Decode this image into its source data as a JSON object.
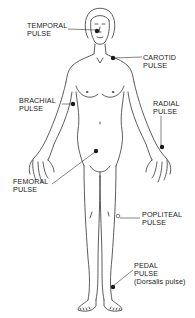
{
  "diagram": {
    "colors": {
      "line": "#333333",
      "dot": "#1a1a1a",
      "background": "#ffffff"
    },
    "pulse_points": [
      {
        "id": "temporal",
        "line1": "TEMPORAL",
        "line2": "PULSE",
        "line3": "",
        "marker": "filled"
      },
      {
        "id": "carotid",
        "line1": "CAROTID",
        "line2": "PULSE",
        "line3": "",
        "marker": "filled"
      },
      {
        "id": "brachial",
        "line1": "BRACHIAL",
        "line2": "PULSE",
        "line3": "",
        "marker": "filled"
      },
      {
        "id": "radial",
        "line1": "RADIAL",
        "line2": "PULSE",
        "line3": "",
        "marker": "filled"
      },
      {
        "id": "femoral",
        "line1": "FEMORAL",
        "line2": "PULSE",
        "line3": "",
        "marker": "filled"
      },
      {
        "id": "popliteal",
        "line1": "POPLITEAL",
        "line2": "PULSE",
        "line3": "",
        "marker": "open"
      },
      {
        "id": "pedal",
        "line1": "PEDAL",
        "line2": "PULSE",
        "line3": "(Dorsalis pulse)",
        "marker": "filled"
      }
    ]
  }
}
